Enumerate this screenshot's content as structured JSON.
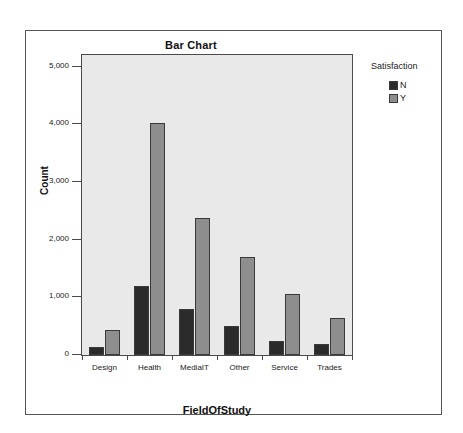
{
  "chart_data": {
    "type": "bar",
    "title": "Bar Chart",
    "xlabel": "FieldOfStudy",
    "ylabel": "Count",
    "categories": [
      "Design",
      "Health",
      "MediaIT",
      "Other",
      "Service",
      "Trades"
    ],
    "series": [
      {
        "name": "N",
        "color": "#2b2b2b",
        "values": [
          140,
          1190,
          800,
          510,
          240,
          190
        ]
      },
      {
        "name": "Y",
        "color": "#8e8e8e",
        "values": [
          440,
          4020,
          2370,
          1700,
          1050,
          650
        ]
      }
    ],
    "ylim": [
      0,
      5200
    ],
    "yticks": [
      0,
      1000,
      2000,
      3000,
      4000,
      5000
    ],
    "ytick_labels": [
      "0",
      "1,000",
      "2,000",
      "3,000",
      "4,000",
      "5,000"
    ],
    "grid": false,
    "legend": {
      "title": "Satisfaction",
      "position": "right",
      "entries": [
        {
          "label": "N",
          "color": "#2b2b2b"
        },
        {
          "label": "Y",
          "color": "#8e8e8e"
        }
      ]
    },
    "plot_background": "#e9e9e9",
    "frame_color": "#4a4a4a"
  }
}
